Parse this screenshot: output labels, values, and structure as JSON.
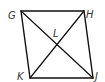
{
  "diagram": {
    "type": "parallelogram",
    "name": "GHJK",
    "colors": {
      "stroke": "#111111",
      "label": "#333333",
      "background": "#ffffff"
    },
    "vertices": [
      {
        "id": "G",
        "label": "G",
        "x": 21,
        "y": 11,
        "label_x": 8,
        "label_y": 19
      },
      {
        "id": "H",
        "label": "H",
        "x": 84,
        "y": 11,
        "label_x": 86,
        "label_y": 18
      },
      {
        "id": "J",
        "label": "J",
        "x": 93,
        "y": 78,
        "label_x": 95,
        "label_y": 80
      },
      {
        "id": "K",
        "label": "K",
        "x": 30,
        "y": 78,
        "label_x": 17,
        "label_y": 80
      }
    ],
    "intersection": {
      "id": "L",
      "label": "L",
      "x": 57,
      "y": 44,
      "label_x": 53,
      "label_y": 37
    },
    "sides": [
      "GH",
      "HJ",
      "JK",
      "KG"
    ],
    "diagonals": [
      "GJ",
      "HK"
    ]
  }
}
